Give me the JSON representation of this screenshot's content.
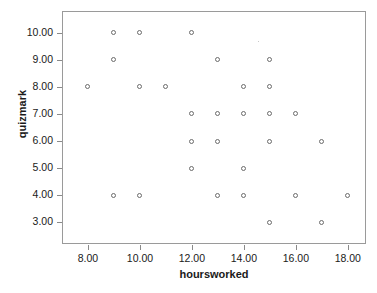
{
  "chart_data": {
    "type": "scatter",
    "title": "",
    "xlabel": "hoursworked",
    "ylabel": "quizmark",
    "xlim": [
      7.0,
      18.7
    ],
    "ylim": [
      2.2,
      10.8
    ],
    "grid": false,
    "legend": null,
    "xticks": [
      "8.00",
      "10.00",
      "12.00",
      "14.00",
      "16.00",
      "18.00"
    ],
    "xtick_values": [
      8,
      10,
      12,
      14,
      16,
      18
    ],
    "yticks": [
      "3.00",
      "4.00",
      "5.00",
      "6.00",
      "7.00",
      "8.00",
      "9.00",
      "10.00"
    ],
    "ytick_values": [
      3,
      4,
      5,
      6,
      7,
      8,
      9,
      10
    ],
    "marker": "open-circle",
    "marker_color": "#6b6b6b",
    "points": [
      {
        "x": 9,
        "y": 10
      },
      {
        "x": 10,
        "y": 10
      },
      {
        "x": 12,
        "y": 10
      },
      {
        "x": 9,
        "y": 9
      },
      {
        "x": 13,
        "y": 9
      },
      {
        "x": 15,
        "y": 9
      },
      {
        "x": 8,
        "y": 8
      },
      {
        "x": 10,
        "y": 8
      },
      {
        "x": 11,
        "y": 8
      },
      {
        "x": 14,
        "y": 8
      },
      {
        "x": 15,
        "y": 8
      },
      {
        "x": 12,
        "y": 7
      },
      {
        "x": 13,
        "y": 7
      },
      {
        "x": 14,
        "y": 7
      },
      {
        "x": 15,
        "y": 7
      },
      {
        "x": 16,
        "y": 7
      },
      {
        "x": 12,
        "y": 6
      },
      {
        "x": 13,
        "y": 6
      },
      {
        "x": 15,
        "y": 6
      },
      {
        "x": 17,
        "y": 6
      },
      {
        "x": 12,
        "y": 5
      },
      {
        "x": 14,
        "y": 5
      },
      {
        "x": 9,
        "y": 4
      },
      {
        "x": 10,
        "y": 4
      },
      {
        "x": 13,
        "y": 4
      },
      {
        "x": 14,
        "y": 4
      },
      {
        "x": 16,
        "y": 4
      },
      {
        "x": 18,
        "y": 4
      },
      {
        "x": 15,
        "y": 3
      },
      {
        "x": 17,
        "y": 3
      }
    ]
  },
  "axis": {
    "x_title": "hoursworked",
    "y_title": "quizmark"
  }
}
